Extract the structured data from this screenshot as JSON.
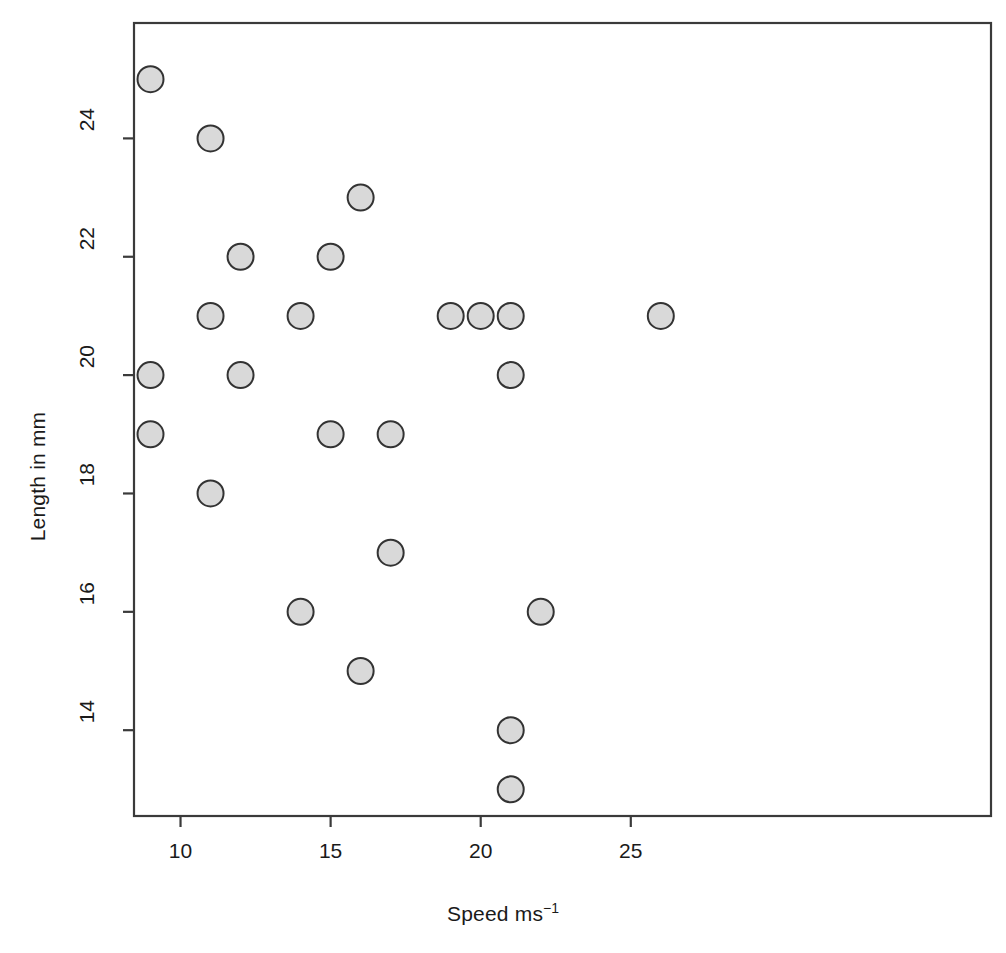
{
  "chart_data": {
    "type": "scatter",
    "title": "",
    "xlabel": "Speed ms",
    "xlabel_sup": "−1",
    "ylabel": "Length in mm",
    "xticks": [
      10,
      15,
      20,
      25
    ],
    "yticks": [
      14,
      16,
      18,
      20,
      22,
      24
    ],
    "xlim": [
      8.45,
      37.0
    ],
    "ylim": [
      12.55,
      25.95
    ],
    "grid": false,
    "legend": null,
    "marker": {
      "shape": "circle",
      "fill": "#d9d9d9",
      "stroke": "#333333",
      "radius_px": 13
    },
    "frame": {
      "stroke": "#3a3a3a",
      "box": true
    },
    "x": [
      9,
      11,
      16,
      12,
      15,
      11,
      14,
      19,
      20,
      21,
      26,
      9,
      12,
      21,
      9,
      15,
      17,
      11,
      17,
      14,
      22,
      16,
      21,
      21
    ],
    "y": [
      25,
      24,
      23,
      22,
      22,
      21,
      21,
      21,
      21,
      21,
      21,
      20,
      20,
      20,
      19,
      19,
      19,
      18,
      17,
      16,
      16,
      15,
      14,
      13
    ],
    "points": [
      {
        "x": 9,
        "y": 25
      },
      {
        "x": 11,
        "y": 24
      },
      {
        "x": 16,
        "y": 23
      },
      {
        "x": 12,
        "y": 22
      },
      {
        "x": 15,
        "y": 22
      },
      {
        "x": 11,
        "y": 21
      },
      {
        "x": 14,
        "y": 21
      },
      {
        "x": 19,
        "y": 21
      },
      {
        "x": 20,
        "y": 21
      },
      {
        "x": 21,
        "y": 21
      },
      {
        "x": 26,
        "y": 21
      },
      {
        "x": 9,
        "y": 20
      },
      {
        "x": 12,
        "y": 20
      },
      {
        "x": 21,
        "y": 20
      },
      {
        "x": 9,
        "y": 19
      },
      {
        "x": 15,
        "y": 19
      },
      {
        "x": 17,
        "y": 19
      },
      {
        "x": 11,
        "y": 18
      },
      {
        "x": 17,
        "y": 17
      },
      {
        "x": 14,
        "y": 16
      },
      {
        "x": 22,
        "y": 16
      },
      {
        "x": 16,
        "y": 15
      },
      {
        "x": 21,
        "y": 14
      },
      {
        "x": 21,
        "y": 13
      }
    ],
    "n_points": 24
  }
}
